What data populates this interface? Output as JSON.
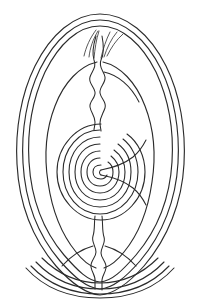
{
  "figure": {
    "title": "Teardrop spiral line drawing",
    "medium": "line-art",
    "background_color": "#ffffff",
    "ink_color": "#2b2b2b",
    "canvas": {
      "width": 201,
      "height": 307
    }
  },
  "geometry": {
    "outer_contours": {
      "count": 3,
      "shape": "teardrop",
      "apex_y": 14,
      "base_y": 296,
      "left_x": 20,
      "right_x": 181
    },
    "inner_ovoid": {
      "count": 1,
      "top_y": 62,
      "bottom_y": 262,
      "left_x": 46,
      "right_x": 156
    },
    "spiral": {
      "turns": 7,
      "center_x": 100,
      "center_y": 172,
      "outer_radius_x": 44,
      "outer_radius_y": 48,
      "direction": "counterclockwise"
    },
    "wedge": {
      "position": "right-of-center",
      "opens": "right",
      "tip_x": 101,
      "tip_y": 172,
      "mouth_x": 146
    },
    "upper_stem": {
      "style": "wavy",
      "top_y": 40,
      "bottom_y": 126,
      "waves": 4
    },
    "lower_stem": {
      "style": "wavy",
      "top_y": 218,
      "bottom_y": 288,
      "waves": 4
    },
    "apex_fan": {
      "lines": 6,
      "top_y": 28,
      "bottom_y": 60
    },
    "base_arcs": {
      "count": 4
    }
  },
  "labels": {
    "alt_text": "Teardrop spiral line drawing"
  }
}
